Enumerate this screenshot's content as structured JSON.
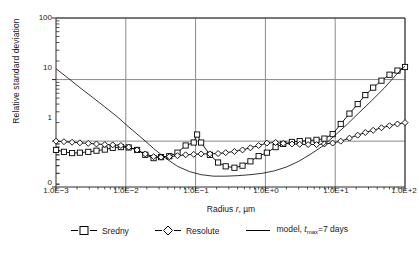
{
  "chart_data": {
    "type": "line",
    "title": "",
    "xlabel": "Radius r, µm",
    "ylabel": "Relative standard deviation",
    "xscale": "log",
    "yscale": "log",
    "xlim": [
      0.001,
      100
    ],
    "ylim": [
      0.18,
      100
    ],
    "xticklabels": [
      "1.0E−3",
      "1.0E−2",
      "1.0E−1",
      "1.0E+0",
      "1.0E+1",
      "1.0E+2"
    ],
    "xtickvalues": [
      0.001,
      0.01,
      0.1,
      1,
      10,
      100
    ],
    "yticklabels": [
      "100",
      "10",
      "1",
      "0"
    ],
    "ytickvalues": [
      100,
      10,
      1,
      0
    ],
    "grid": "major x and y gridlines, gray",
    "legend_position": "below plot, horizontal",
    "series": [
      {
        "name": "Sredny",
        "marker": "square",
        "color": "#000000",
        "x": [
          0.001,
          0.0013,
          0.0017,
          0.0022,
          0.0029,
          0.0038,
          0.005,
          0.0065,
          0.0085,
          0.011,
          0.0145,
          0.019,
          0.025,
          0.032,
          0.042,
          0.055,
          0.072,
          0.094,
          0.105,
          0.12,
          0.16,
          0.21,
          0.27,
          0.36,
          0.47,
          0.61,
          0.8,
          1.05,
          1.4,
          1.8,
          2.4,
          3.1,
          4.1,
          5.4,
          7.0,
          9.2,
          12,
          16,
          21,
          27,
          35,
          46,
          60,
          78,
          100
        ],
        "y": [
          0.72,
          0.67,
          0.64,
          0.65,
          0.67,
          0.7,
          0.73,
          0.78,
          0.8,
          0.79,
          0.72,
          0.6,
          0.53,
          0.55,
          0.57,
          0.65,
          0.85,
          0.95,
          1.28,
          0.95,
          0.6,
          0.45,
          0.39,
          0.37,
          0.4,
          0.47,
          0.57,
          0.65,
          0.8,
          0.9,
          0.97,
          1.0,
          1.02,
          1.05,
          1.1,
          1.3,
          1.9,
          2.8,
          4.0,
          5.6,
          7.4,
          9.6,
          12,
          14,
          16
        ]
      },
      {
        "name": "Resolute",
        "marker": "diamond",
        "color": "#000000",
        "x": [
          0.001,
          0.0013,
          0.0017,
          0.0022,
          0.0029,
          0.0038,
          0.005,
          0.0065,
          0.0085,
          0.011,
          0.0145,
          0.019,
          0.025,
          0.032,
          0.042,
          0.055,
          0.072,
          0.094,
          0.12,
          0.16,
          0.21,
          0.27,
          0.36,
          0.47,
          0.61,
          0.8,
          1.05,
          1.4,
          1.8,
          2.4,
          3.1,
          4.1,
          5.4,
          7.0,
          9.2,
          12,
          16,
          21,
          27,
          35,
          46,
          60,
          78,
          100
        ],
        "y": [
          1.0,
          0.98,
          0.96,
          0.94,
          0.92,
          0.9,
          0.88,
          0.87,
          0.85,
          0.8,
          0.72,
          0.62,
          0.56,
          0.55,
          0.56,
          0.58,
          0.6,
          0.61,
          0.62,
          0.62,
          0.63,
          0.65,
          0.68,
          0.72,
          0.78,
          0.85,
          0.93,
          0.95,
          0.92,
          0.9,
          0.89,
          0.88,
          0.88,
          0.9,
          0.93,
          1.0,
          1.12,
          1.25,
          1.38,
          1.5,
          1.65,
          1.78,
          1.9,
          2.0
        ]
      },
      {
        "name": "model, tmax=7 days",
        "marker": "none",
        "color": "#000000",
        "x": [
          0.001,
          0.0015,
          0.0022,
          0.0033,
          0.005,
          0.0075,
          0.011,
          0.017,
          0.025,
          0.037,
          0.055,
          0.082,
          0.12,
          0.18,
          0.27,
          0.4,
          0.6,
          0.9,
          1.35,
          2.0,
          3.0,
          4.5,
          6.8,
          10,
          15,
          22,
          33,
          50,
          75,
          100
        ],
        "y": [
          15.0,
          10.5,
          7.4,
          5.2,
          3.6,
          2.5,
          1.7,
          1.12,
          0.76,
          0.53,
          0.39,
          0.32,
          0.285,
          0.27,
          0.27,
          0.275,
          0.285,
          0.3,
          0.33,
          0.38,
          0.47,
          0.62,
          0.85,
          1.25,
          1.9,
          2.9,
          4.5,
          7.2,
          12.0,
          16.5
        ]
      }
    ]
  },
  "axis": {
    "ylabel_text": "Relative standard deviation",
    "xlabel_prefix": "Radius ",
    "xlabel_var": "r",
    "xlabel_suffix": ", µm",
    "yticks": [
      "100",
      "10",
      "1",
      "0"
    ],
    "xticks": [
      "1.0E−3",
      "1.0E−2",
      "1.0E−1",
      "1.0E+0",
      "1.0E+1",
      "1.0E+2"
    ]
  },
  "legend": {
    "items": [
      {
        "label": "Sredny",
        "marker": "square"
      },
      {
        "label": "Resolute",
        "marker": "diamond"
      },
      {
        "label_pre": "model, ",
        "label_var": "t",
        "label_sub": "max",
        "label_post": "=7 days",
        "marker": "line"
      }
    ]
  }
}
